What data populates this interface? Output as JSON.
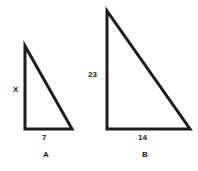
{
  "figure": {
    "background_color": "#ffffff",
    "stroke_color": "#1c1c1c",
    "stroke_width": 3,
    "text_color": "#1a1a1a"
  },
  "triangles": [
    {
      "id": "A",
      "name_label": "A",
      "vertical_side_label": "X",
      "base_label": "7",
      "apex": {
        "x": 25,
        "y": 46
      },
      "bottom_left": {
        "x": 25,
        "y": 129
      },
      "bottom_right": {
        "x": 72,
        "y": 129
      }
    },
    {
      "id": "B",
      "name_label": "B",
      "vertical_side_label": "23",
      "base_label": "14",
      "apex": {
        "x": 107,
        "y": 11
      },
      "bottom_left": {
        "x": 107,
        "y": 129
      },
      "bottom_right": {
        "x": 190,
        "y": 129
      }
    }
  ],
  "labels": {
    "triangle_a_height": "X",
    "triangle_a_base": "7",
    "triangle_a_name": "A",
    "triangle_b_height": "23",
    "triangle_b_base": "14",
    "triangle_b_name": "B"
  },
  "chart_data": {
    "type": "diagram",
    "title": "",
    "shapes": [
      {
        "label": "A",
        "type": "right-triangle",
        "height_label": "X",
        "base_label": "7",
        "orientation": "right-angle-bottom-left"
      },
      {
        "label": "B",
        "type": "right-triangle",
        "height_label": "23",
        "base_label": "14",
        "orientation": "right-angle-bottom-left"
      }
    ]
  }
}
